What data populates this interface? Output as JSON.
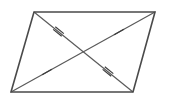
{
  "figure": {
    "background_color": "#ffffff",
    "canvas": {
      "width": 177,
      "height": 111
    },
    "stroke_color_edge": "#4a4a4a",
    "stroke_color_diagonal": "#5a5a5a",
    "stroke_color_tick": "#3c3c3c"
  },
  "vertices": {
    "top_left": {
      "label": "",
      "x": 34,
      "y": 12
    },
    "top_right": {
      "label": "",
      "x": 155,
      "y": 12
    },
    "bottom_right": {
      "label": "",
      "x": 133,
      "y": 92
    },
    "bottom_left": {
      "label": "",
      "x": 11,
      "y": 92
    }
  },
  "intersection": {
    "label": "",
    "x": 83.25,
    "y": 52
  },
  "polygon": {
    "name": "parallelogram",
    "points": "34,12 155,12 133,92 11,92"
  },
  "edges": [
    {
      "name": "top-edge",
      "x1": 34,
      "y1": 12,
      "x2": 155,
      "y2": 12
    },
    {
      "name": "right-edge",
      "x1": 155,
      "y1": 12,
      "x2": 133,
      "y2": 92
    },
    {
      "name": "bottom-edge",
      "x1": 133,
      "y1": 92,
      "x2": 11,
      "y2": 92
    },
    {
      "name": "left-edge",
      "x1": 11,
      "y1": 92,
      "x2": 34,
      "y2": 12
    }
  ],
  "diagonals": [
    {
      "name": "diagonal-topleft-to-bottomright",
      "x1": 34,
      "y1": 12,
      "x2": 133,
      "y2": 92
    },
    {
      "name": "diagonal-topright-to-bottomleft",
      "x1": 155,
      "y1": 12,
      "x2": 11,
      "y2": 92
    }
  ],
  "tick_marks": [
    {
      "name": "tick-upper-left-segment",
      "count": 2,
      "segment": "top-left-to-center",
      "cx": 58.5,
      "cy": 31.5,
      "angle_deg": 39,
      "length": 11,
      "spacing": 3.4
    },
    {
      "name": "tick-lower-right-segment",
      "count": 2,
      "segment": "center-to-bottom-right",
      "cx": 108.0,
      "cy": 71.5,
      "angle_deg": 39,
      "length": 11,
      "spacing": 3.4
    },
    {
      "name": "tick-upper-right-segment",
      "count": 1,
      "segment": "top-right-to-center",
      "cx": 119.0,
      "cy": 32.0,
      "angle_deg": -29,
      "length": 11,
      "spacing": 0
    },
    {
      "name": "tick-lower-left-segment",
      "count": 1,
      "segment": "center-to-bottom-left",
      "cx": 47.0,
      "cy": 72.0,
      "angle_deg": -29,
      "length": 11,
      "spacing": 0
    }
  ]
}
